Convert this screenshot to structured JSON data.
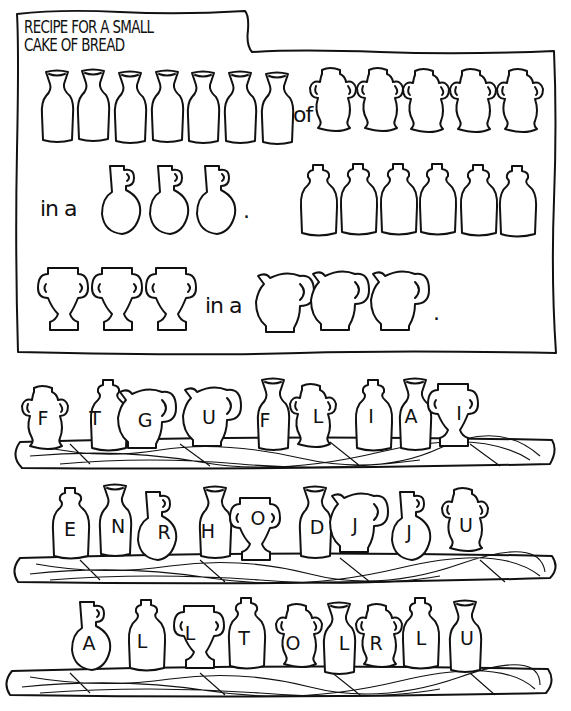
{
  "puzzle": {
    "title_line1": "RECIPE FOR A SMALL",
    "title_line2": "CAKE OF BREAD",
    "recipe": {
      "row1": {
        "jars_before": {
          "type": "tall-bottle",
          "count": 7
        },
        "connector": "of",
        "jars_after": {
          "type": "amphora",
          "count": 5
        }
      },
      "row2": {
        "prefix": "in a",
        "jars": {
          "type": "round-jug",
          "count": 3
        },
        "period": ".",
        "jars_after": {
          "type": "corked-bottle",
          "count": 6
        }
      },
      "row3": {
        "jars_before": {
          "type": "footed-cup",
          "count": 3
        },
        "connector": "in a",
        "jars_after": {
          "type": "pitcher",
          "count": 3
        },
        "period": "."
      }
    },
    "shelves": [
      {
        "letters": [
          "F",
          "T",
          "G",
          "U",
          "F",
          "L",
          "I",
          "A",
          "I"
        ],
        "jars": [
          "amphora",
          "corked-bottle",
          "pitcher",
          "pitcher",
          "tall-bottle",
          "amphora",
          "corked-bottle",
          "tall-bottle",
          "footed-cup"
        ]
      },
      {
        "letters": [
          "E",
          "N",
          "R",
          "H",
          "O",
          "D",
          "J",
          "J",
          "U"
        ],
        "jars": [
          "corked-bottle",
          "tall-bottle",
          "round-jug",
          "tall-bottle",
          "footed-cup",
          "tall-bottle",
          "pitcher",
          "round-jug",
          "amphora"
        ]
      },
      {
        "letters": [
          "A",
          "L",
          "L",
          "T",
          "O",
          "L",
          "R",
          "L",
          "U"
        ],
        "jars": [
          "round-jug",
          "corked-bottle",
          "footed-cup",
          "corked-bottle",
          "amphora",
          "tall-bottle",
          "amphora",
          "corked-bottle",
          "tall-bottle"
        ]
      }
    ]
  }
}
